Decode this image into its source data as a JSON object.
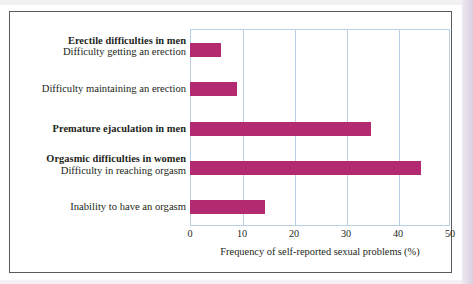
{
  "chart_data": {
    "type": "bar",
    "orientation": "horizontal",
    "title": "",
    "xlabel": "Frequency of self-reported sexual problems (%)",
    "ylabel": "",
    "xlim": [
      0,
      50
    ],
    "xticks": [
      0,
      10,
      20,
      30,
      40,
      50
    ],
    "xtick_labels": [
      "0",
      "10",
      "20",
      "30",
      "40",
      "50"
    ],
    "grid": true,
    "legend": false,
    "bar_color": "#b42a70",
    "gridline_color": "#b9cfe3",
    "groups": [
      {
        "heading": "Erectile difficulties in men"
      },
      {
        "heading": "Orgasmic difficulties in women"
      }
    ],
    "categories": [
      "Difficulty getting an erection",
      "Difficulty maintaining an erection",
      "Premature ejaculation in men",
      "Difficulty in reaching orgasm",
      "Inability to have an orgasm"
    ],
    "values": [
      6,
      9,
      34.8,
      44.5,
      14.5
    ],
    "rows": [
      {
        "heading": "Erectile difficulties in men",
        "label": "Difficulty getting an erection",
        "value": 6
      },
      {
        "heading": "",
        "label": "Difficulty maintaining an erection",
        "value": 9
      },
      {
        "heading": "",
        "label": "Premature ejaculation in men",
        "label_bold": true,
        "value": 34.8
      },
      {
        "heading": "Orgasmic difficulties in women",
        "label": "Difficulty in reaching orgasm",
        "value": 44.5
      },
      {
        "heading": "",
        "label": "Inability to have an orgasm",
        "value": 14.5
      }
    ]
  }
}
